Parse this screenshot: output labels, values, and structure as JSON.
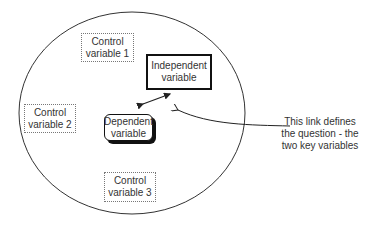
{
  "diagram": {
    "controls": [
      {
        "line1": "Control",
        "line2": "variable 1"
      },
      {
        "line1": "Control",
        "line2": "variable 2"
      },
      {
        "line1": "Control",
        "line2": "variable 3"
      }
    ],
    "independent": {
      "line1": "Independent",
      "line2": "variable"
    },
    "dependent": {
      "line1": "Dependent",
      "line2": "variable"
    },
    "annotation": {
      "line1": "This link defines",
      "line2": "the question - the",
      "line3": "two key variables"
    },
    "colors": {
      "stroke": "#222222",
      "dotted_border": "#777777",
      "background": "#ffffff"
    }
  }
}
